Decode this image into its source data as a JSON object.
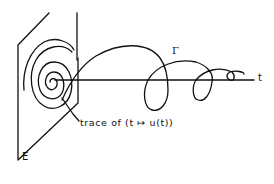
{
  "diagram": {
    "labels": {
      "plane": "E",
      "curve": "Γ",
      "axis": "t",
      "trace": "trace of (t ↦ u(t))"
    },
    "colors": {
      "stroke": "#111111",
      "background": "#ffffff"
    }
  }
}
